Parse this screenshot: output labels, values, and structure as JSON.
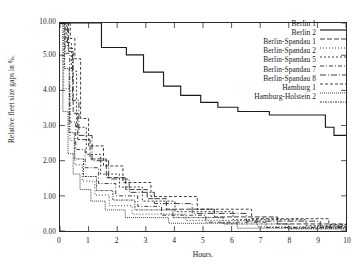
{
  "chart_data": {
    "type": "line",
    "title": "",
    "xlabel": "Hours.",
    "ylabel": "Relative fleet size gaps in %.",
    "xlim": [
      0,
      10
    ],
    "ylim": [
      0,
      10
    ],
    "grid": false,
    "legend_position": "upper-right",
    "y_axis_note": "broken axis: linear 0.00-5.00, compressed 5.00-10.00",
    "xticks": [
      "0",
      "1",
      "2",
      "3",
      "4",
      "5",
      "6",
      "7",
      "8",
      "9",
      "10"
    ],
    "xtick_values": [
      0,
      1,
      2,
      3,
      4,
      5,
      6,
      7,
      8,
      9,
      10
    ],
    "yticks": [
      "0.00",
      "1.00",
      "2.00",
      "3.00",
      "4.00",
      "5.00",
      "10.00"
    ],
    "ytick_values": [
      0,
      1,
      2,
      3,
      4,
      5,
      10
    ],
    "series": [
      {
        "name": "Berlin 1",
        "dash": "none",
        "width": 1.15,
        "points": [
          [
            0.0,
            10.0
          ],
          [
            1.45,
            10.0
          ],
          [
            1.45,
            6.2
          ],
          [
            2.32,
            6.2
          ],
          [
            2.32,
            5.05
          ],
          [
            2.92,
            5.05
          ],
          [
            2.92,
            4.52
          ],
          [
            3.62,
            4.52
          ],
          [
            3.62,
            4.12
          ],
          [
            4.22,
            4.12
          ],
          [
            4.22,
            3.86
          ],
          [
            4.92,
            3.86
          ],
          [
            4.92,
            3.66
          ],
          [
            5.52,
            3.66
          ],
          [
            5.52,
            3.52
          ],
          [
            6.22,
            3.52
          ],
          [
            6.22,
            3.4
          ],
          [
            7.32,
            3.4
          ],
          [
            7.32,
            3.3
          ],
          [
            9.28,
            3.3
          ],
          [
            9.28,
            2.95
          ],
          [
            9.58,
            2.95
          ],
          [
            9.58,
            2.72
          ],
          [
            10.0,
            2.72
          ]
        ]
      },
      {
        "name": "Berlin 2",
        "dash": "5,2",
        "width": 0.85,
        "points": [
          [
            0.0,
            10.0
          ],
          [
            0.3,
            10.0
          ],
          [
            0.3,
            5.6
          ],
          [
            0.46,
            5.6
          ],
          [
            0.46,
            3.35
          ],
          [
            0.62,
            3.35
          ],
          [
            0.62,
            2.6
          ],
          [
            1.05,
            2.6
          ],
          [
            1.05,
            2.05
          ],
          [
            1.62,
            2.05
          ],
          [
            1.62,
            1.52
          ],
          [
            2.3,
            1.52
          ],
          [
            2.3,
            1.18
          ],
          [
            3.05,
            1.18
          ],
          [
            3.05,
            0.92
          ],
          [
            3.72,
            0.92
          ],
          [
            3.72,
            0.62
          ],
          [
            5.4,
            0.62
          ],
          [
            5.4,
            0.4
          ],
          [
            7.6,
            0.4
          ],
          [
            7.6,
            0.2
          ],
          [
            10.0,
            0.2
          ]
        ]
      },
      {
        "name": "Berlin-Spandau 1",
        "dash": "1,2",
        "width": 0.85,
        "points": [
          [
            0.0,
            10.0
          ],
          [
            0.13,
            10.0
          ],
          [
            0.13,
            4.05
          ],
          [
            0.35,
            4.05
          ],
          [
            0.35,
            2.58
          ],
          [
            0.52,
            2.58
          ],
          [
            0.52,
            1.88
          ],
          [
            0.78,
            1.88
          ],
          [
            0.78,
            1.42
          ],
          [
            1.22,
            1.42
          ],
          [
            1.22,
            1.02
          ],
          [
            1.72,
            1.02
          ],
          [
            1.72,
            0.72
          ],
          [
            2.52,
            0.72
          ],
          [
            2.52,
            0.48
          ],
          [
            4.4,
            0.48
          ],
          [
            4.4,
            0.3
          ],
          [
            6.9,
            0.3
          ],
          [
            6.9,
            0.12
          ],
          [
            10.0,
            0.12
          ]
        ]
      },
      {
        "name": "Berlin-Spandau 2",
        "dash": "2,2",
        "width": 0.85,
        "points": [
          [
            0.0,
            10.0
          ],
          [
            0.22,
            10.0
          ],
          [
            0.22,
            6.95
          ],
          [
            0.4,
            6.95
          ],
          [
            0.4,
            4.55
          ],
          [
            0.58,
            4.55
          ],
          [
            0.58,
            2.95
          ],
          [
            0.92,
            2.95
          ],
          [
            0.92,
            2.18
          ],
          [
            1.42,
            2.18
          ],
          [
            1.42,
            1.62
          ],
          [
            2.08,
            1.62
          ],
          [
            2.08,
            1.25
          ],
          [
            2.88,
            1.25
          ],
          [
            2.88,
            0.85
          ],
          [
            4.02,
            0.85
          ],
          [
            4.02,
            0.55
          ],
          [
            6.05,
            0.55
          ],
          [
            6.05,
            0.32
          ],
          [
            8.6,
            0.32
          ],
          [
            8.6,
            0.15
          ],
          [
            10.0,
            0.15
          ]
        ]
      },
      {
        "name": "Berlin-Spandau 5",
        "dash": "4,2,1,2",
        "width": 0.85,
        "points": [
          [
            0.0,
            10.0
          ],
          [
            0.18,
            10.0
          ],
          [
            0.18,
            5.3
          ],
          [
            0.34,
            5.3
          ],
          [
            0.34,
            3.1
          ],
          [
            0.55,
            3.1
          ],
          [
            0.55,
            2.32
          ],
          [
            0.88,
            2.32
          ],
          [
            0.88,
            1.8
          ],
          [
            1.35,
            1.8
          ],
          [
            1.35,
            1.35
          ],
          [
            1.95,
            1.35
          ],
          [
            1.95,
            1.0
          ],
          [
            2.72,
            1.0
          ],
          [
            2.72,
            0.7
          ],
          [
            3.55,
            0.7
          ],
          [
            3.55,
            0.45
          ],
          [
            5.1,
            0.45
          ],
          [
            5.1,
            0.25
          ],
          [
            7.2,
            0.25
          ],
          [
            7.2,
            0.1
          ],
          [
            10.0,
            0.1
          ]
        ]
      },
      {
        "name": "Berlin-Spandau 7",
        "dash": "6,2,1,2",
        "width": 0.85,
        "points": [
          [
            0.0,
            10.0
          ],
          [
            0.26,
            10.0
          ],
          [
            0.26,
            6.1
          ],
          [
            0.44,
            6.1
          ],
          [
            0.44,
            3.72
          ],
          [
            0.66,
            3.72
          ],
          [
            0.66,
            2.72
          ],
          [
            1.12,
            2.72
          ],
          [
            1.12,
            2.0
          ],
          [
            1.7,
            2.0
          ],
          [
            1.7,
            1.48
          ],
          [
            2.42,
            1.48
          ],
          [
            2.42,
            1.1
          ],
          [
            3.3,
            1.1
          ],
          [
            3.3,
            0.78
          ],
          [
            4.62,
            0.78
          ],
          [
            4.62,
            0.5
          ],
          [
            6.52,
            0.5
          ],
          [
            6.52,
            0.28
          ],
          [
            9.1,
            0.28
          ],
          [
            9.1,
            0.12
          ],
          [
            10.0,
            0.12
          ]
        ]
      },
      {
        "name": "Berlin-Spandau 8",
        "dash": "3,2",
        "width": 0.85,
        "points": [
          [
            0.0,
            10.0
          ],
          [
            0.36,
            10.0
          ],
          [
            0.36,
            7.6
          ],
          [
            0.52,
            7.6
          ],
          [
            0.52,
            4.9
          ],
          [
            0.72,
            4.9
          ],
          [
            0.72,
            3.2
          ],
          [
            1.0,
            3.2
          ],
          [
            1.0,
            2.42
          ],
          [
            1.52,
            2.42
          ],
          [
            1.52,
            1.85
          ],
          [
            2.2,
            1.85
          ],
          [
            2.2,
            1.38
          ],
          [
            3.18,
            1.38
          ],
          [
            3.18,
            0.98
          ],
          [
            4.8,
            0.98
          ],
          [
            4.8,
            0.62
          ],
          [
            6.7,
            0.62
          ],
          [
            6.7,
            0.35
          ],
          [
            9.4,
            0.35
          ],
          [
            9.4,
            0.18
          ],
          [
            10.0,
            0.18
          ]
        ]
      },
      {
        "name": "Hamburg 1",
        "dash": "1,1",
        "width": 0.85,
        "points": [
          [
            0.0,
            10.0
          ],
          [
            0.1,
            10.0
          ],
          [
            0.1,
            3.4
          ],
          [
            0.28,
            3.4
          ],
          [
            0.28,
            2.2
          ],
          [
            0.46,
            2.2
          ],
          [
            0.46,
            1.62
          ],
          [
            0.7,
            1.62
          ],
          [
            0.7,
            1.18
          ],
          [
            1.08,
            1.18
          ],
          [
            1.08,
            0.85
          ],
          [
            1.58,
            0.85
          ],
          [
            1.58,
            0.6
          ],
          [
            2.28,
            0.6
          ],
          [
            2.28,
            0.38
          ],
          [
            3.8,
            0.38
          ],
          [
            3.8,
            0.22
          ],
          [
            6.2,
            0.22
          ],
          [
            6.2,
            0.08
          ],
          [
            10.0,
            0.08
          ]
        ]
      },
      {
        "name": "Hamburg-Holstein 2",
        "dash": "2,1,1,1",
        "width": 0.85,
        "points": [
          [
            0.0,
            10.0
          ],
          [
            0.16,
            10.0
          ],
          [
            0.16,
            4.62
          ],
          [
            0.32,
            4.62
          ],
          [
            0.32,
            2.8
          ],
          [
            0.5,
            2.8
          ],
          [
            0.5,
            2.05
          ],
          [
            0.82,
            2.05
          ],
          [
            0.82,
            1.55
          ],
          [
            1.28,
            1.55
          ],
          [
            1.28,
            1.15
          ],
          [
            1.85,
            1.15
          ],
          [
            1.85,
            0.88
          ],
          [
            2.62,
            0.88
          ],
          [
            2.62,
            0.6
          ],
          [
            3.95,
            0.6
          ],
          [
            3.95,
            0.38
          ],
          [
            5.7,
            0.38
          ],
          [
            5.7,
            0.2
          ],
          [
            8.0,
            0.2
          ],
          [
            8.0,
            0.06
          ],
          [
            10.0,
            0.06
          ]
        ]
      }
    ]
  }
}
